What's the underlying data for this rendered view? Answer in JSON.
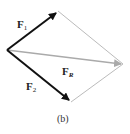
{
  "diagram": {
    "type": "parallelogram-law-vector-addition",
    "vectors": [
      {
        "name": "F1",
        "label_main": "F",
        "label_sub": "1",
        "color": "#111111"
      },
      {
        "name": "F2",
        "label_main": "F",
        "label_sub": "2",
        "color": "#111111"
      },
      {
        "name": "FR",
        "label_main": "F",
        "label_sub": "R",
        "color": "#aaaaaa"
      }
    ],
    "caption": "(b)",
    "construction_line_color": "#bbbbbb"
  }
}
